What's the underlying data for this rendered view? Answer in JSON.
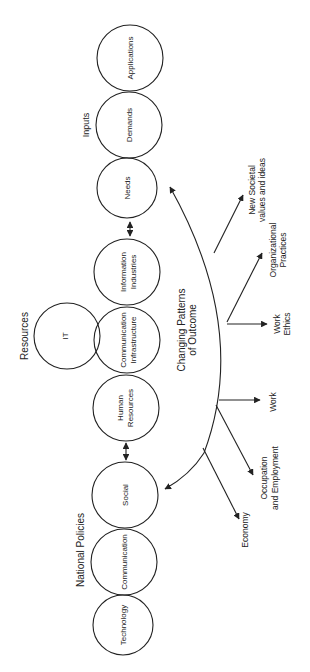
{
  "groups": {
    "inputs": "Inputs",
    "resources": "Resources",
    "national_policies": "National Policies"
  },
  "nodes": {
    "applications": [
      "Applications"
    ],
    "demands": [
      "Demands"
    ],
    "needs": [
      "Needs"
    ],
    "information_industries": [
      "Information",
      "Industries"
    ],
    "communication_infrastructure": [
      "Communication",
      "Infrastructure"
    ],
    "it": [
      "IT"
    ],
    "human_resources": [
      "Human",
      "Resources"
    ],
    "social": [
      "Social"
    ],
    "communication": [
      "Communication"
    ],
    "technology": [
      "Technology"
    ]
  },
  "center_label": [
    "Changing Patterns",
    "of Outcome"
  ],
  "outcomes": {
    "new_societal": [
      "New Societal",
      "values and ideas"
    ],
    "organizational": [
      "Organizational",
      "Practices"
    ],
    "work_ethics": [
      "Work",
      "Ethics"
    ],
    "work": [
      "Work"
    ],
    "occupation": [
      "Occupation",
      "and Employment"
    ],
    "economy": [
      "Economy"
    ]
  },
  "colors": {
    "stroke": "#222222",
    "background": "#ffffff"
  }
}
